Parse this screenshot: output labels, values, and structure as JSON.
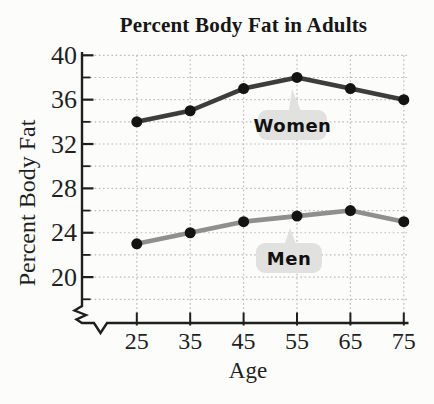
{
  "figure": {
    "background": "#fcfcfa"
  },
  "chart_data": {
    "type": "line",
    "title": "Percent Body Fat in Adults",
    "xlabel": "Age",
    "ylabel": "Percent Body Fat",
    "categories": [
      25,
      35,
      45,
      55,
      65,
      75
    ],
    "series": [
      {
        "name": "Women",
        "values": [
          34,
          35,
          37,
          38,
          37,
          36
        ],
        "line_color": "#3d3d3b"
      },
      {
        "name": "Men",
        "values": [
          23,
          24,
          25,
          25.5,
          26,
          25
        ],
        "line_color": "#8f8f8d"
      }
    ],
    "marker_color": "#141414",
    "ylim": [
      18,
      40
    ],
    "y_major_ticks": [
      20,
      24,
      28,
      32,
      36,
      40
    ],
    "y_minor_ticks": [
      18,
      22,
      26,
      30,
      34,
      38
    ],
    "y_gridline_step": 2,
    "x_axis_break": true,
    "grid": "dotted",
    "grid_color": "#bcbcbc",
    "axis_color": "#1f1f1f",
    "callout_bg": "#e1e1df",
    "annotations": [
      {
        "label": "Women",
        "anchor_x": 55,
        "anchor_y": 38
      },
      {
        "label": "Men",
        "anchor_x": 55,
        "anchor_y": 25.5
      }
    ],
    "legend_position": "inline-callouts"
  }
}
